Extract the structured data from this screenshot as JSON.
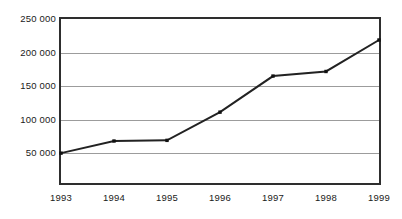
{
  "chart_data": {
    "type": "line",
    "title": "",
    "xlabel": "",
    "ylabel": "",
    "categories": [
      "1993",
      "1994",
      "1995",
      "1996",
      "1997",
      "1998",
      "1999"
    ],
    "values": [
      45500,
      64000,
      65000,
      108000,
      163000,
      170000,
      218000
    ],
    "series": [
      {
        "name": "",
        "values": [
          45500,
          64000,
          65000,
          108000,
          163000,
          170000,
          218000
        ]
      }
    ],
    "ylim": [
      0,
      250000
    ],
    "xlim": [
      "1993",
      "1999"
    ],
    "ytick_values": [
      250000,
      200000,
      150000,
      100000,
      50000
    ],
    "ytick_labels": [
      "250 000",
      "200 000",
      "150 000",
      "100 000",
      "50 000"
    ],
    "xtick_labels": [
      "1993",
      "1994",
      "1995",
      "1996",
      "1997",
      "1998",
      "1999"
    ],
    "grid": true,
    "grid_orientation": "horizontal",
    "legend": false,
    "legend_position": "none",
    "marker": "square",
    "line_color": "#222222",
    "marker_color": "#111111",
    "grid_color": "#9c9c9c",
    "frame_color": "#2e2e2e",
    "background_color": "#ffffff",
    "text_color": "#1a1a1a"
  },
  "axes": {
    "y": {
      "ticks": [
        {
          "label": "250 000",
          "value": 250000
        },
        {
          "label": "200 000",
          "value": 200000
        },
        {
          "label": "150 000",
          "value": 150000
        },
        {
          "label": "100 000",
          "value": 100000
        },
        {
          "label": "50 000",
          "value": 50000
        }
      ]
    },
    "x": {
      "ticks": [
        {
          "label": "1993"
        },
        {
          "label": "1994"
        },
        {
          "label": "1995"
        },
        {
          "label": "1996"
        },
        {
          "label": "1997"
        },
        {
          "label": "1998"
        },
        {
          "label": "1999"
        }
      ]
    }
  }
}
